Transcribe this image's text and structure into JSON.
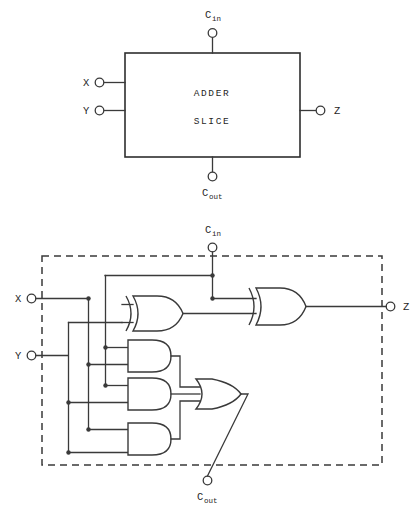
{
  "figure": {
    "line_color": "#3a3a3a",
    "background": "#ffffff"
  },
  "block_diagram": {
    "name": "adder-slice-block",
    "box_label_line1": "ADDER",
    "box_label_line2": "SLICE",
    "inputs": [
      {
        "label": "X",
        "side": "left"
      },
      {
        "label": "Y",
        "side": "left"
      },
      {
        "label": "C",
        "sub": "in",
        "side": "top"
      }
    ],
    "outputs": [
      {
        "label": "Z",
        "side": "right"
      },
      {
        "label": "C",
        "sub": "out",
        "side": "bottom"
      }
    ]
  },
  "gate_diagram": {
    "name": "adder-slice-gates",
    "boundary_style": "dashed",
    "inputs": [
      {
        "label": "X",
        "side": "left"
      },
      {
        "label": "Y",
        "side": "left"
      },
      {
        "label": "C",
        "sub": "in",
        "side": "top"
      }
    ],
    "outputs": [
      {
        "label": "Z",
        "side": "right"
      },
      {
        "label": "C",
        "sub": "out",
        "side": "bottom"
      }
    ],
    "gates": [
      {
        "id": "xor1",
        "type": "XOR",
        "inputs": 2
      },
      {
        "id": "xor2",
        "type": "XOR",
        "inputs": 2
      },
      {
        "id": "and1",
        "type": "AND",
        "inputs": 2
      },
      {
        "id": "and2",
        "type": "AND",
        "inputs": 2
      },
      {
        "id": "and3",
        "type": "AND",
        "inputs": 2
      },
      {
        "id": "or1",
        "type": "OR",
        "inputs": 3
      }
    ]
  },
  "labels": {
    "x": "X",
    "y": "Y",
    "z": "Z",
    "c": "C",
    "sub_in": "in",
    "sub_out": "out",
    "adder": "ADDER",
    "slice": "SLICE"
  }
}
